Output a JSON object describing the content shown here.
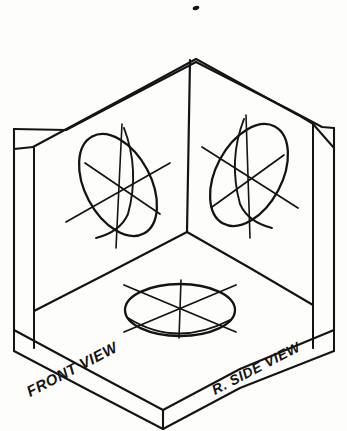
{
  "figure": {
    "type": "technical-line-drawing",
    "background_color": "#fdfdfc",
    "ink_color": "#141414",
    "style": "hand-inked isometric sketch"
  },
  "labels": {
    "front_view": "FRONT VIEW",
    "right_side_view": "R. SIDE VIEW"
  },
  "geometry": {
    "box": {
      "description": "Open isometric corner box formed by three slab panels with visible edge thickness",
      "apex_outer": [
        196,
        62
      ],
      "apex_inner": [
        196,
        58
      ],
      "inner_corner": [
        186,
        232
      ],
      "left_panel_outer_top": [
        14,
        128
      ],
      "right_panel_outer_top": [
        334,
        128
      ],
      "bottom_front_corner": [
        163,
        424
      ],
      "slab_thickness_px": 20
    },
    "circles": [
      {
        "name": "front-face-circle",
        "plane": "front vertical face",
        "center": [
          118,
          185
        ],
        "rx": 33,
        "ry": 55,
        "rotation_deg": -28,
        "axis_lines": 3
      },
      {
        "name": "right-face-circle",
        "plane": "right side vertical face",
        "center": [
          249,
          175
        ],
        "rx": 33,
        "ry": 55,
        "rotation_deg": 28,
        "axis_lines": 3
      },
      {
        "name": "bottom-face-circle",
        "plane": "horizontal bottom face",
        "center": [
          180,
          310
        ],
        "rx": 55,
        "ry": 26,
        "rotation_deg": 0,
        "axis_lines": 3
      }
    ],
    "ink_speck": {
      "name": "stray-ink-mark",
      "position": [
        196,
        8
      ]
    }
  }
}
